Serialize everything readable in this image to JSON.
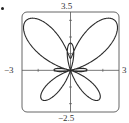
{
  "chart_data": {
    "type": "line",
    "title": "",
    "equation": "r = e^(sin θ) - 2cos(4θ)",
    "param": {
      "theta_min": 0,
      "theta_max": 6.283185307,
      "samples": 720
    },
    "xlabel": "",
    "ylabel": "",
    "xlim": [
      -3,
      3
    ],
    "ylim": [
      -2.5,
      3.5
    ],
    "tick_labels": {
      "xmin": "−3",
      "xmax": "3",
      "ymin": "−2.5",
      "ymax": "3.5"
    },
    "x_ticks": [
      -2,
      -1,
      1,
      2
    ],
    "y_ticks": [
      -2,
      -1,
      1,
      2,
      3
    ],
    "grid": false,
    "legend": null,
    "key_points": [
      {
        "theta": "π/2",
        "r": 0.718,
        "note": "small top loop"
      },
      {
        "theta": "π/4",
        "r": 4.03,
        "note": "upper-right wing tip"
      },
      {
        "theta": "−π/4",
        "r": 2.49,
        "note": "lower-right wing tip"
      },
      {
        "theta": "0",
        "r": -1,
        "note": "small horizontal loop"
      }
    ]
  },
  "colors": {
    "curve": "#2b2b2b",
    "axes": "#555555",
    "frame": "#555555",
    "text": "#333333"
  },
  "bullet": "•"
}
